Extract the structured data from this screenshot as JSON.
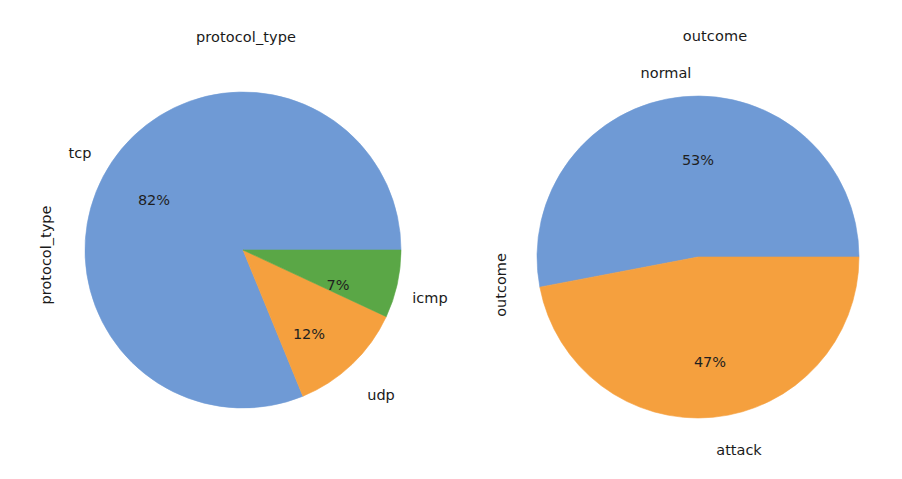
{
  "figure": {
    "width": 902,
    "height": 479,
    "background": "#ffffff"
  },
  "palette": {
    "blue": "#6f9ad5",
    "orange": "#f5a03e",
    "green": "#5aa746",
    "text": "#1a1a1a"
  },
  "chart_data": [
    {
      "type": "pie",
      "title": "protocol_type",
      "ylabel": "protocol_type",
      "xlabel": "",
      "categories": [
        "tcp",
        "udp",
        "icmp"
      ],
      "values": [
        82,
        12,
        7
      ],
      "labels": [
        "82%",
        "12%",
        "7%"
      ],
      "colors": [
        "#6f9ad5",
        "#f5a03e",
        "#5aa746"
      ],
      "legend": "none",
      "grid": false,
      "annotations": [
        {
          "text": "tcp",
          "kind": "wedge-label"
        },
        {
          "text": "udp",
          "kind": "wedge-label"
        },
        {
          "text": "icmp",
          "kind": "wedge-label"
        },
        {
          "text": "82%",
          "kind": "autopct"
        },
        {
          "text": "12%",
          "kind": "autopct"
        },
        {
          "text": "7%",
          "kind": "autopct"
        }
      ]
    },
    {
      "type": "pie",
      "title": "outcome",
      "ylabel": "outcome",
      "xlabel": "",
      "categories": [
        "normal",
        "attack"
      ],
      "values": [
        53,
        47
      ],
      "labels": [
        "53%",
        "47%"
      ],
      "colors": [
        "#6f9ad5",
        "#f5a03e"
      ],
      "legend": "none",
      "grid": false,
      "annotations": [
        {
          "text": "normal",
          "kind": "wedge-label"
        },
        {
          "text": "attack",
          "kind": "wedge-label"
        },
        {
          "text": "53%",
          "kind": "autopct"
        },
        {
          "text": "47%",
          "kind": "autopct"
        }
      ]
    }
  ],
  "left_chart": {
    "title": "protocol_type",
    "y_axis_label": "protocol_type",
    "wedge_labels": {
      "tcp": "tcp",
      "udp": "udp",
      "icmp": "icmp"
    },
    "percent_labels": {
      "tcp": "82%",
      "udp": "12%",
      "icmp": "7%"
    }
  },
  "right_chart": {
    "title": "outcome",
    "y_axis_label": "outcome",
    "wedge_labels": {
      "normal": "normal",
      "attack": "attack"
    },
    "percent_labels": {
      "normal": "53%",
      "attack": "47%"
    }
  }
}
